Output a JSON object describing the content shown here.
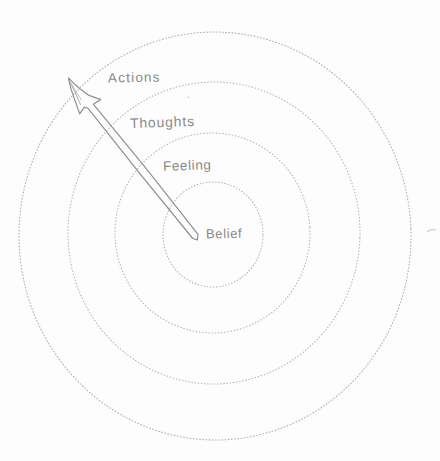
{
  "diagram": {
    "type": "concentric-rings",
    "rings": [
      {
        "label": "Belief"
      },
      {
        "label": "Feeling"
      },
      {
        "label": "Thoughts"
      },
      {
        "label": "Actions"
      }
    ],
    "arrow": {
      "from": "Belief",
      "to": "Actions",
      "direction": "outward"
    },
    "colors": {
      "ink": "#8f8f8f",
      "ring_stroke": "#b4b4b4",
      "background": "#fdfdfd"
    }
  }
}
